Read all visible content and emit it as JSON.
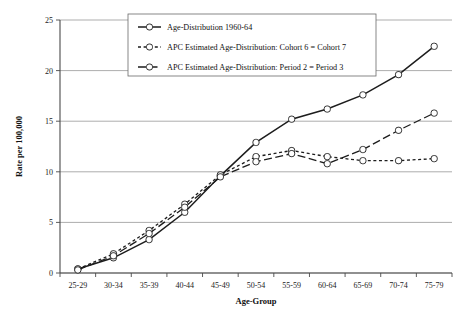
{
  "chart_data": {
    "type": "line",
    "title": "",
    "xlabel": "Age-Group",
    "ylabel": "Rate per 100,000",
    "categories": [
      "25-29",
      "30-34",
      "35-39",
      "40-44",
      "45-49",
      "50-54",
      "55-59",
      "60-64",
      "65-69",
      "70-74",
      "75-79"
    ],
    "ylim": [
      0,
      25
    ],
    "yticks": [
      0,
      5,
      10,
      15,
      20,
      25
    ],
    "grid": true,
    "legend_position": "top-center",
    "series": [
      {
        "name": "Age-Distribution 1960-64",
        "style": "solid",
        "marker": "circle",
        "values": [
          0.4,
          1.5,
          3.3,
          6.0,
          9.6,
          12.9,
          15.2,
          16.2,
          17.6,
          19.6,
          22.4
        ]
      },
      {
        "name": "APC Estimated Age-Distribution: Cohort 6 = Cohort 7",
        "style": "dotted",
        "marker": "circle",
        "values": [
          0.4,
          1.9,
          4.2,
          6.8,
          9.7,
          11.5,
          12.1,
          11.5,
          11.1,
          11.1,
          11.3
        ]
      },
      {
        "name": "APC Estimated Age-Distribution: Period 2 = Period 3",
        "style": "dashed",
        "marker": "circle",
        "values": [
          0.3,
          1.7,
          3.9,
          6.5,
          9.5,
          11.0,
          11.8,
          10.8,
          12.2,
          14.1,
          15.8
        ]
      }
    ]
  },
  "legend": {
    "items": [
      {
        "label": "Age-Distribution 1960-64"
      },
      {
        "label": "APC Estimated Age-Distribution: Cohort 6 = Cohort 7"
      },
      {
        "label": "APC Estimated Age-Distribution: Period 2 = Period 3"
      }
    ]
  },
  "colors": {
    "line": "#1d1d1d",
    "grid": "#8a8a8a",
    "axis": "#4a4a4a",
    "background": "#ffffff"
  }
}
